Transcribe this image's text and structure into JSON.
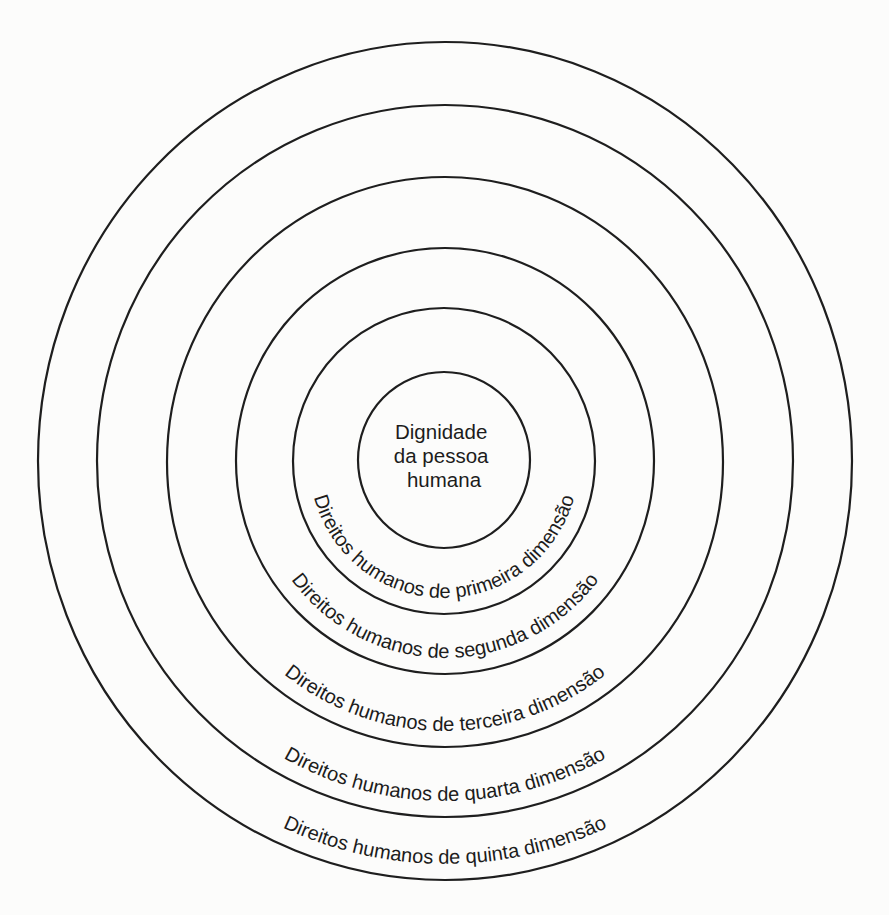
{
  "diagram": {
    "type": "concentric-circles",
    "center_label": {
      "lines": [
        "Dignidade",
        "da pessoa",
        "humana"
      ]
    },
    "rings": [
      {
        "id": "core",
        "label": "",
        "cx": 444,
        "cy": 460,
        "rx": 86,
        "ry": 88
      },
      {
        "id": "primeira",
        "label": "Direitos humanos de primeira dimensão",
        "cx": 444,
        "cy": 461,
        "rx": 151,
        "ry": 153
      },
      {
        "id": "segunda",
        "label": "Direitos humanos de segunda dimensão",
        "cx": 445,
        "cy": 461,
        "rx": 209,
        "ry": 213
      },
      {
        "id": "terceira",
        "label": "Direitos humanos de terceira dimensão",
        "cx": 445,
        "cy": 462,
        "rx": 278,
        "ry": 285
      },
      {
        "id": "quarta",
        "label": "Direitos humanos de quarta dimensão",
        "cx": 445,
        "cy": 461,
        "rx": 348,
        "ry": 356
      },
      {
        "id": "quinta",
        "label": "Direitos humanos de quinta dimensão",
        "cx": 445,
        "cy": 461,
        "rx": 407,
        "ry": 419
      }
    ],
    "label_baseline_inset": 16,
    "colors": {
      "background": "#fcfcfb",
      "stroke": "#1e1e1e",
      "text": "#1c1c1c"
    }
  }
}
